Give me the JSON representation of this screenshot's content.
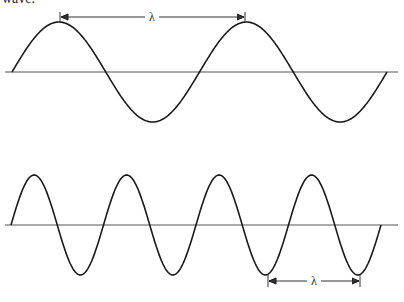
{
  "caption": "wave.",
  "colors": {
    "wave": "#1a1a1a",
    "axis": "#555555",
    "arrow": "#333333"
  },
  "diagrams": [
    {
      "id": "long-wave",
      "cycles": 2.0,
      "label": "λ",
      "label_measures": "peak to peak"
    },
    {
      "id": "short-wave",
      "cycles": 4.0,
      "label": "λ",
      "label_measures": "trough to trough"
    }
  ]
}
